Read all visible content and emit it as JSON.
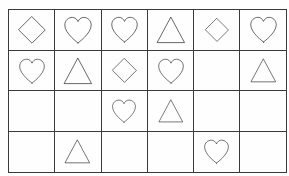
{
  "page": {
    "background_color": "#fefefe",
    "width": 289,
    "height": 176
  },
  "grid": {
    "name": "shape-grid",
    "columns": 6,
    "rows": 4,
    "line_color": "#3a3a3c",
    "shape_stroke_color": "#18181a",
    "shape_fill": "none",
    "cell_width": 45,
    "cell_height": 40,
    "shape_legend": {
      "diamond": "diamond-shape",
      "heart": "heart-shape",
      "triangle": "triangle-shape",
      "empty": "empty-cell"
    },
    "cells": [
      [
        {
          "shape": "diamond",
          "size": 30
        },
        {
          "shape": "heart",
          "size": 30
        },
        {
          "shape": "heart",
          "size": 29
        },
        {
          "shape": "triangle",
          "size": 30
        },
        {
          "shape": "diamond",
          "size": 26
        },
        {
          "shape": "heart",
          "size": 29
        }
      ],
      [
        {
          "shape": "heart",
          "size": 28
        },
        {
          "shape": "triangle",
          "size": 30
        },
        {
          "shape": "diamond",
          "size": 27
        },
        {
          "shape": "heart",
          "size": 28
        },
        {
          "shape": "empty",
          "size": 0
        },
        {
          "shape": "triangle",
          "size": 27
        }
      ],
      [
        {
          "shape": "empty",
          "size": 0
        },
        {
          "shape": "empty",
          "size": 0
        },
        {
          "shape": "heart",
          "size": 26
        },
        {
          "shape": "triangle",
          "size": 26
        },
        {
          "shape": "empty",
          "size": 0
        },
        {
          "shape": "empty",
          "size": 0
        }
      ],
      [
        {
          "shape": "empty",
          "size": 0
        },
        {
          "shape": "triangle",
          "size": 27
        },
        {
          "shape": "empty",
          "size": 0
        },
        {
          "shape": "empty",
          "size": 0
        },
        {
          "shape": "heart",
          "size": 27
        },
        {
          "shape": "empty",
          "size": 0
        }
      ]
    ],
    "counts": {
      "diamond": 3,
      "heart": 8,
      "triangle": 5,
      "empty": 8,
      "total_cells": 24
    }
  }
}
